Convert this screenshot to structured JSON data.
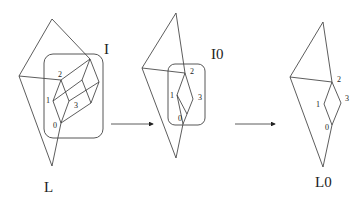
{
  "figures": [
    {
      "id": "L",
      "label": "L",
      "box_label": "I",
      "vertex_labels": [
        "0",
        "1",
        "2",
        "3"
      ]
    },
    {
      "id": "L_intermediate",
      "box_label": "I0",
      "vertex_labels": [
        "0",
        "1",
        "2",
        "3"
      ]
    },
    {
      "id": "L0",
      "label": "L0",
      "vertex_labels": [
        "0",
        "1",
        "2",
        "3"
      ]
    }
  ],
  "arrows": [
    {
      "from": "figure-1",
      "to": "figure-2"
    },
    {
      "from": "figure-2",
      "to": "figure-3"
    }
  ]
}
